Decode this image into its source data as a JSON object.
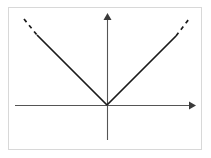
{
  "figure": {
    "title": "Absolute value function graph",
    "caption": "",
    "background_color": "#ffffff",
    "frame": {
      "border_color": "#d8d8d8",
      "fill_color": "#ffffff",
      "x": 8,
      "y": 7,
      "width": 194,
      "height": 143
    }
  },
  "chart_data": {
    "type": "line",
    "title": "",
    "subtitle": "",
    "xlabel": "",
    "ylabel": "",
    "xlim": [
      -5,
      5
    ],
    "ylim": [
      -1.6,
      5
    ],
    "grid": false,
    "legend": null,
    "annotations": [],
    "axes": {
      "x_axis": {
        "color": "#555555",
        "y_position_px": 105,
        "x_start_px": 15,
        "x_end_px": 196,
        "arrow_start": false,
        "arrow_end": true
      },
      "y_axis": {
        "color": "#555555",
        "x_position_px": 107,
        "y_start_px": 140,
        "y_end_px": 13,
        "arrow_start": false,
        "arrow_end": true
      },
      "origin_px": {
        "x": 107,
        "y": 105
      }
    },
    "series": [
      {
        "name": "y = |x|",
        "color": "#1a1a1a",
        "style": "solid",
        "x": [
          -2.35,
          0,
          2.3
        ],
        "y": [
          2.35,
          0,
          2.3
        ],
        "points_px": [
          {
            "x": 37,
            "y": 35
          },
          {
            "x": 107,
            "y": 105
          },
          {
            "x": 176,
            "y": 36
          }
        ]
      },
      {
        "name": "y = |x| left extension",
        "color": "#1a1a1a",
        "style": "dashed",
        "x": [
          -2.8,
          -2.35
        ],
        "y": [
          2.8,
          2.35
        ],
        "points_px": [
          {
            "x": 24,
            "y": 19
          },
          {
            "x": 37,
            "y": 35
          }
        ]
      },
      {
        "name": "y = |x| right extension",
        "color": "#1a1a1a",
        "style": "dashed",
        "x": [
          2.3,
          2.8
        ],
        "y": [
          2.3,
          2.8
        ],
        "points_px": [
          {
            "x": 176,
            "y": 36
          },
          {
            "x": 189,
            "y": 19
          }
        ]
      }
    ],
    "vertex": {
      "x": 0,
      "y": 0,
      "label": ""
    },
    "x_ticks": [],
    "y_ticks": [],
    "x_tick_labels": [],
    "y_tick_labels": []
  }
}
